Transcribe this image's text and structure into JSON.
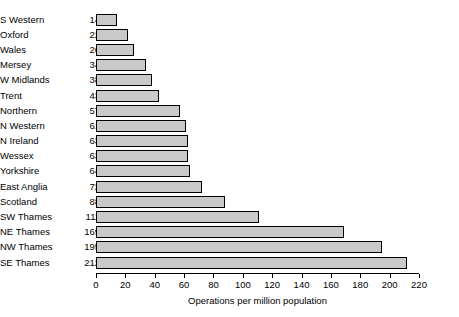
{
  "chart_data": {
    "type": "bar",
    "orientation": "horizontal",
    "title": "",
    "subtitle": "",
    "xlabel": "Operations per million population",
    "ylabel": "",
    "xlim": [
      0,
      220
    ],
    "xticks": [
      0,
      20,
      40,
      60,
      80,
      100,
      120,
      140,
      160,
      180,
      200,
      220
    ],
    "grid": false,
    "legend": null,
    "bar_fill_color": "#c9c9c9",
    "bar_edge_color": "#000000",
    "categories": [
      "S Western",
      "Oxford",
      "Wales",
      "Mersey",
      "W Midlands",
      "Trent",
      "Northern",
      "N Western",
      "N Ireland",
      "Wessex",
      "Yorkshire",
      "East Anglia",
      "Scotland",
      "SW Thames",
      "NE Thames",
      "NW Thames",
      "SE Thames"
    ],
    "values": [
      14,
      22,
      26,
      34,
      38,
      43,
      57,
      61,
      63,
      63,
      64,
      72,
      88,
      111,
      169,
      195,
      212
    ]
  }
}
